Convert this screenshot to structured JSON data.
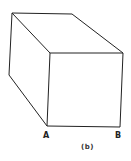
{
  "figure": {
    "caption": "(b)",
    "labels": {
      "a": "A",
      "b": "B"
    },
    "shape": "cube-perspective",
    "stroke_color": "#222222"
  }
}
